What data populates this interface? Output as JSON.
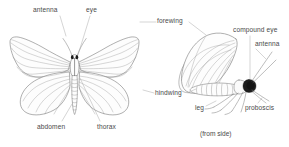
{
  "figure": {
    "title_caption": "(from side)",
    "style": {
      "background": "#ffffff",
      "outline_color": "#6e6e6e",
      "vein_color": "#8c8c8c",
      "leader_color": "#9a9a9a",
      "body_fill": "#fbfbfb",
      "eye_color": "#1a1a1a",
      "text_color": "#4a4a4a"
    },
    "views": [
      {
        "name": "dorsal-view",
        "description": "moth with wings spread, viewed from above",
        "caption": ""
      },
      {
        "name": "lateral-view",
        "description": "moth with wings folded, viewed from the side",
        "caption": "(from side)"
      }
    ],
    "labels": [
      {
        "id": "antenna-left",
        "text": "antenna",
        "x": 33,
        "y": 6,
        "anchor": "start"
      },
      {
        "id": "eye-left",
        "text": "eye",
        "x": 86,
        "y": 6,
        "anchor": "start"
      },
      {
        "id": "forewing",
        "text": "forewing",
        "x": 157,
        "y": 17,
        "anchor": "start"
      },
      {
        "id": "compound-eye",
        "text": "compound eye",
        "x": 233,
        "y": 26,
        "anchor": "start"
      },
      {
        "id": "antenna-right",
        "text": "antenna",
        "x": 255,
        "y": 40,
        "anchor": "start"
      },
      {
        "id": "hindwing",
        "text": "hindwing",
        "x": 155,
        "y": 89,
        "anchor": "start"
      },
      {
        "id": "abdomen",
        "text": "abdomen",
        "x": 37,
        "y": 123,
        "anchor": "start"
      },
      {
        "id": "thorax",
        "text": "thorax",
        "x": 97,
        "y": 123,
        "anchor": "start"
      },
      {
        "id": "leg",
        "text": "leg",
        "x": 195,
        "y": 104,
        "anchor": "start"
      },
      {
        "id": "proboscis",
        "text": "proboscis",
        "x": 245,
        "y": 104,
        "anchor": "start"
      },
      {
        "id": "from-side",
        "text": "(from side)",
        "x": 200,
        "y": 130,
        "anchor": "start"
      }
    ]
  }
}
